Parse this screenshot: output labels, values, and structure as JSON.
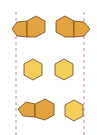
{
  "diagram": {
    "colors": {
      "dark_fill": "#e3a33e",
      "light_fill": "#f3cf5a",
      "stroke": "#6b4a1e",
      "guide_line": "#d97fb0"
    },
    "guide_lines": [
      {
        "x": 16,
        "y1": 12,
        "y2": 135
      },
      {
        "x": 84,
        "y1": 12,
        "y2": 135
      }
    ],
    "rows": [
      {
        "left": "pentagon+hexagon",
        "right": "hexagon+pentagon"
      },
      {
        "left": "hexagon",
        "right": "hexagon"
      },
      {
        "left": "pentagon+hexagon",
        "right": "hexagon"
      }
    ]
  }
}
